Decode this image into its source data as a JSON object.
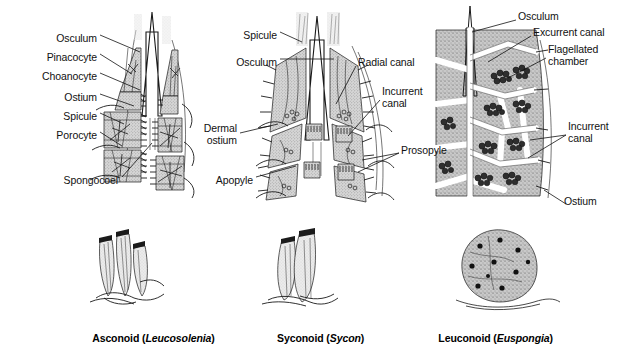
{
  "figure": {
    "background": "#ffffff",
    "ink_color": "#1a1a1a",
    "tissue_fill": "#b9b9b9",
    "panels": [
      {
        "id": "asconoid",
        "caption_type": "Asconoid",
        "caption_genus": "Leucosolenia",
        "labels": [
          {
            "name": "osculum",
            "text": "Osculum",
            "align": "right",
            "x": 97,
            "y": 38
          },
          {
            "name": "pinacocyte",
            "text": "Pinacocyte",
            "align": "right",
            "x": 97,
            "y": 57
          },
          {
            "name": "choanocyte",
            "text": "Choanocyte",
            "align": "right",
            "x": 97,
            "y": 76
          },
          {
            "name": "ostium",
            "text": "Ostium",
            "align": "right",
            "x": 97,
            "y": 97
          },
          {
            "name": "spicule",
            "text": "Spicule",
            "align": "right",
            "x": 97,
            "y": 116
          },
          {
            "name": "porocyte",
            "text": "Porocyte",
            "align": "right",
            "x": 97,
            "y": 135
          },
          {
            "name": "spongocoel",
            "text": "Spongocoel",
            "align": "right",
            "x": 118,
            "y": 180
          }
        ]
      },
      {
        "id": "syconoid",
        "caption_type": "Syconoid",
        "caption_genus": "Sycon",
        "labels": [
          {
            "name": "spicule",
            "text": "Spicule",
            "align": "right",
            "x": 277,
            "y": 35
          },
          {
            "name": "osculum",
            "text": "Osculum",
            "align": "right",
            "x": 277,
            "y": 62
          },
          {
            "name": "dermal-ostium",
            "text": "Dermal\nostium",
            "align": "right",
            "x": 237,
            "y": 128
          },
          {
            "name": "apopyle",
            "text": "Apopyle",
            "align": "right",
            "x": 253,
            "y": 180
          },
          {
            "name": "radial-canal",
            "text": "Radial canal",
            "align": "left",
            "x": 358,
            "y": 62
          },
          {
            "name": "incurrent-canal",
            "text": "Incurrent\ncanal",
            "align": "left",
            "x": 382,
            "y": 91
          },
          {
            "name": "prosopyle",
            "text": "Prosopyle",
            "align": "left",
            "x": 401,
            "y": 150
          }
        ]
      },
      {
        "id": "leuconoid",
        "caption_type": "Leuconoid",
        "caption_genus": "Euspongia",
        "labels": [
          {
            "name": "osculum",
            "text": "Osculum",
            "align": "left",
            "x": 518,
            "y": 16
          },
          {
            "name": "excurrent-canal",
            "text": "Excurrent canal",
            "align": "left",
            "x": 533,
            "y": 32
          },
          {
            "name": "flagellated-chamber",
            "text": "Flagellated\nchamber",
            "align": "left",
            "x": 548,
            "y": 49
          },
          {
            "name": "incurrent-canal",
            "text": "Incurrent\ncanal",
            "align": "left",
            "x": 568,
            "y": 126
          },
          {
            "name": "ostium",
            "text": "Ostium",
            "align": "left",
            "x": 564,
            "y": 201
          }
        ]
      }
    ],
    "captions": [
      {
        "name": "asconoid",
        "type": "Asconoid",
        "genus": "Leucosolenia",
        "cx": 148,
        "y": 326
      },
      {
        "name": "syconoid",
        "type": "Syconoid",
        "genus": "Sycon",
        "cx": 315,
        "y": 326
      },
      {
        "name": "leuconoid",
        "type": "Leuconoid",
        "genus": "Euspongia",
        "cx": 490,
        "y": 326
      }
    ]
  }
}
